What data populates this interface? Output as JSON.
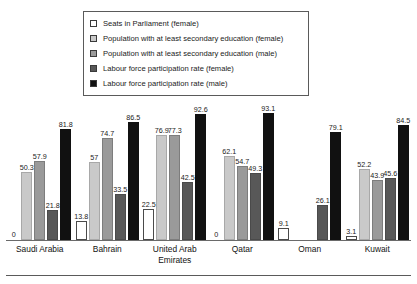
{
  "chart_data": {
    "type": "bar",
    "title": "",
    "subtitle": "",
    "xlabel": "",
    "ylabel": "",
    "ylim": [
      0,
      100
    ],
    "grid": false,
    "legend_position": "top-center",
    "categories": [
      "Saudi Arabia",
      "Bahrain",
      "United Arab Emirates",
      "Qatar",
      "Oman",
      "Kuwait"
    ],
    "series": [
      {
        "name": "Seats in Parliament (female)",
        "color": "#ffffff",
        "values": [
          0,
          13.8,
          22.5,
          0,
          9.1,
          3.1
        ],
        "labels": [
          "0",
          "13.8",
          "22.5",
          "0",
          "9.1",
          "3.1"
        ]
      },
      {
        "name": "Population with at least secondary education (female)",
        "color": "#c9c9c9",
        "values": [
          50.3,
          57,
          76.9,
          62.1,
          null,
          52.2
        ],
        "labels": [
          "50.3",
          "57",
          "76.9",
          "62.1",
          "",
          "52.2"
        ]
      },
      {
        "name": "Population with at least secondary education (male)",
        "color": "#9a9a9a",
        "values": [
          57.9,
          74.7,
          77.3,
          54.7,
          null,
          43.9
        ],
        "labels": [
          "57.9",
          "74.7",
          "77.3",
          "54.7",
          "",
          "43.9"
        ]
      },
      {
        "name": "Labour force participation rate (female)",
        "color": "#585858",
        "values": [
          21.8,
          33.5,
          42.5,
          49.3,
          26.1,
          45.6
        ],
        "labels": [
          "21.8",
          "33.5",
          "42.5",
          "49.3",
          "26.1",
          "45.6"
        ]
      },
      {
        "name": "Labour force participation rate (male)",
        "color": "#111111",
        "values": [
          81.8,
          86.5,
          92.6,
          93.1,
          79.1,
          84.5
        ],
        "labels": [
          "81.8",
          "86.5",
          "92.6",
          "93.1",
          "79.1",
          "84.5"
        ]
      }
    ]
  },
  "legend": {
    "items": [
      {
        "label": "Seats in Parliament (female)",
        "swatch": "#ffffff"
      },
      {
        "label": "Population with at least secondary education (female)",
        "swatch": "#c9c9c9"
      },
      {
        "label": "Population with at least secondary education (male)",
        "swatch": "#9a9a9a"
      },
      {
        "label": "Labour force participation rate (female)",
        "swatch": "#585858"
      },
      {
        "label": "Labour force participation rate (male)",
        "swatch": "#111111"
      }
    ]
  }
}
